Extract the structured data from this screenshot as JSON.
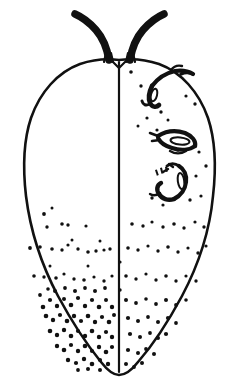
{
  "figure": {
    "subject_name": "scale-insect-dorsal-view",
    "background_color": "#ffffff",
    "ink_color": "#111111",
    "view": "dorsal",
    "canvas": {
      "width": 239,
      "height": 390
    },
    "style": "stippled pen-and-ink scientific illustration",
    "symmetry": "bilateral, right half bears appendages, left half plain"
  },
  "body": {
    "name": "body-outline",
    "shape": "ovoid, broadest above middle, tapering to rounded bilobed posterior",
    "outline_stroke_width": 2.6,
    "midline": {
      "name": "median-longitudinal-line",
      "x": 119,
      "y_top": 62,
      "y_bottom": 372,
      "stroke_width": 2.2
    },
    "extents": {
      "left_x": 24,
      "right_x": 215,
      "top_y": 58,
      "bottom_y": 376,
      "widest_y": 185
    },
    "outline_path": "M 119 60 C 104 58 92 60 80 64 C 58 72 40 92 31 118 C 23 142 23 170 26 196 C 30 228 41 264 58 296 C 72 322 88 346 101 362 C 108 371 113 375 119 375 C 125 375 131 371 138 362 C 152 346 168 322 182 296 C 199 264 210 228 213 196 C 216 170 216 142 208 118 C 199 92 181 72 159 64 C 147 60 134 58 119 60 Z"
  },
  "antennae": [
    {
      "name": "antenna-left",
      "side": "left",
      "segments": 7,
      "base_x": 109,
      "base_y": 58,
      "tip_x": 75,
      "tip_y": 14,
      "description": "thick segmented appendage curving up and outward with pale segment divisions"
    },
    {
      "name": "antenna-right",
      "side": "right",
      "segments": 7,
      "base_x": 130,
      "base_y": 58,
      "tip_x": 164,
      "tip_y": 14,
      "description": "thick segmented appendage curving up and outward, mirror of left"
    }
  ],
  "legs": [
    {
      "name": "leg-anterior-right",
      "position": "anterior right, crossing the body margin",
      "cx": 170,
      "cy": 78,
      "description": "slender jointed leg projecting beyond the body outline"
    },
    {
      "name": "leg-middle-right",
      "position": "mid right",
      "cx": 180,
      "cy": 140,
      "description": "flattened wing-like leg lying on the dorsum"
    },
    {
      "name": "leg-posterior-right",
      "position": "posterior right",
      "cx": 178,
      "cy": 185,
      "description": "bent jointed leg with pale femoral area"
    }
  ],
  "stippling": {
    "name": "dorsal-stippling",
    "description": "scattered pore/seta dots, sparse across the disc and very dense at the posterior left quadrant",
    "dot_color": "#111111",
    "density_zones": [
      {
        "zone": "upper-half",
        "density": "absent to very sparse"
      },
      {
        "zone": "mid-band-rows",
        "density": "sparse, aligned in loose transverse rows"
      },
      {
        "zone": "posterior-left",
        "density": "very dense cluster"
      },
      {
        "zone": "posterior-right",
        "density": "moderate"
      }
    ],
    "dots": [
      [
        44,
        214,
        1.9
      ],
      [
        47,
        227,
        1.7
      ],
      [
        62,
        224,
        1.8
      ],
      [
        68,
        225,
        1.7
      ],
      [
        86,
        226,
        1.6
      ],
      [
        52,
        208,
        1.5
      ],
      [
        30,
        248,
        1.9
      ],
      [
        40,
        247,
        1.8
      ],
      [
        52,
        249,
        1.8
      ],
      [
        62,
        250,
        1.7
      ],
      [
        68,
        245,
        1.6
      ],
      [
        78,
        249,
        1.7
      ],
      [
        88,
        252,
        1.8
      ],
      [
        96,
        251,
        1.7
      ],
      [
        104,
        250,
        1.6
      ],
      [
        110,
        249,
        1.7
      ],
      [
        100,
        241,
        1.5
      ],
      [
        72,
        240,
        1.5
      ],
      [
        34,
        276,
        1.8
      ],
      [
        44,
        277,
        1.7
      ],
      [
        56,
        278,
        1.8
      ],
      [
        64,
        274,
        1.6
      ],
      [
        74,
        279,
        1.7
      ],
      [
        84,
        280,
        1.8
      ],
      [
        94,
        277,
        1.6
      ],
      [
        104,
        281,
        1.7
      ],
      [
        112,
        276,
        1.6
      ],
      [
        50,
        266,
        1.5
      ],
      [
        88,
        266,
        1.5
      ],
      [
        43,
        307,
        2.3
      ],
      [
        50,
        300,
        2.1
      ],
      [
        57,
        306,
        2.2
      ],
      [
        64,
        299,
        2.0
      ],
      [
        71,
        305,
        2.3
      ],
      [
        78,
        298,
        2.1
      ],
      [
        85,
        306,
        2.2
      ],
      [
        92,
        300,
        2.1
      ],
      [
        99,
        307,
        2.3
      ],
      [
        106,
        300,
        2.0
      ],
      [
        112,
        307,
        2.2
      ],
      [
        46,
        316,
        2.3
      ],
      [
        53,
        320,
        2.2
      ],
      [
        60,
        315,
        2.1
      ],
      [
        67,
        321,
        2.3
      ],
      [
        74,
        316,
        2.2
      ],
      [
        81,
        321,
        2.1
      ],
      [
        88,
        316,
        2.3
      ],
      [
        95,
        322,
        2.2
      ],
      [
        102,
        317,
        2.1
      ],
      [
        109,
        322,
        2.3
      ],
      [
        114,
        315,
        2.0
      ],
      [
        50,
        331,
        2.3
      ],
      [
        57,
        335,
        2.2
      ],
      [
        64,
        330,
        2.2
      ],
      [
        71,
        336,
        2.3
      ],
      [
        78,
        331,
        2.1
      ],
      [
        85,
        336,
        2.2
      ],
      [
        92,
        331,
        2.3
      ],
      [
        99,
        337,
        2.2
      ],
      [
        106,
        332,
        2.1
      ],
      [
        112,
        337,
        2.2
      ],
      [
        57,
        346,
        2.2
      ],
      [
        64,
        350,
        2.3
      ],
      [
        71,
        345,
        2.1
      ],
      [
        78,
        351,
        2.2
      ],
      [
        85,
        346,
        2.3
      ],
      [
        92,
        351,
        2.1
      ],
      [
        99,
        347,
        2.2
      ],
      [
        106,
        352,
        2.3
      ],
      [
        112,
        347,
        2.1
      ],
      [
        68,
        360,
        2.2
      ],
      [
        76,
        363,
        2.1
      ],
      [
        84,
        359,
        2.2
      ],
      [
        92,
        364,
        2.3
      ],
      [
        100,
        360,
        2.1
      ],
      [
        108,
        364,
        2.2
      ],
      [
        88,
        369,
        2.0
      ],
      [
        100,
        370,
        2.0
      ],
      [
        78,
        370,
        1.9
      ],
      [
        55,
        291,
        2.0
      ],
      [
        65,
        288,
        1.9
      ],
      [
        75,
        291,
        2.0
      ],
      [
        85,
        288,
        1.9
      ],
      [
        95,
        291,
        2.0
      ],
      [
        105,
        288,
        1.9
      ],
      [
        40,
        295,
        1.9
      ],
      [
        48,
        289,
        1.8
      ],
      [
        131,
        72,
        1.8
      ],
      [
        141,
        86,
        1.7
      ],
      [
        152,
        98,
        1.6
      ],
      [
        161,
        112,
        1.7
      ],
      [
        147,
        118,
        1.6
      ],
      [
        138,
        126,
        1.5
      ],
      [
        157,
        130,
        1.6
      ],
      [
        168,
        120,
        1.5
      ],
      [
        195,
        104,
        1.7
      ],
      [
        186,
        96,
        1.6
      ],
      [
        178,
        150,
        1.7
      ],
      [
        199,
        152,
        1.6
      ],
      [
        206,
        166,
        1.7
      ],
      [
        196,
        176,
        1.6
      ],
      [
        152,
        198,
        1.7
      ],
      [
        163,
        205,
        1.6
      ],
      [
        190,
        200,
        1.7
      ],
      [
        201,
        196,
        1.6
      ],
      [
        132,
        224,
        1.8
      ],
      [
        143,
        226,
        1.7
      ],
      [
        152,
        222,
        1.6
      ],
      [
        163,
        227,
        1.7
      ],
      [
        174,
        224,
        1.8
      ],
      [
        184,
        228,
        1.7
      ],
      [
        195,
        222,
        1.6
      ],
      [
        204,
        227,
        1.7
      ],
      [
        128,
        248,
        1.8
      ],
      [
        138,
        250,
        1.7
      ],
      [
        148,
        246,
        1.6
      ],
      [
        158,
        251,
        1.7
      ],
      [
        168,
        247,
        1.8
      ],
      [
        178,
        252,
        1.7
      ],
      [
        188,
        248,
        1.6
      ],
      [
        198,
        253,
        1.7
      ],
      [
        206,
        246,
        1.6
      ],
      [
        126,
        276,
        1.8
      ],
      [
        136,
        279,
        1.7
      ],
      [
        146,
        274,
        1.6
      ],
      [
        156,
        280,
        1.7
      ],
      [
        166,
        276,
        1.8
      ],
      [
        176,
        281,
        1.7
      ],
      [
        186,
        276,
        1.6
      ],
      [
        196,
        281,
        1.7
      ],
      [
        126,
        300,
        2.0
      ],
      [
        136,
        303,
        1.9
      ],
      [
        146,
        299,
        1.8
      ],
      [
        156,
        304,
        1.9
      ],
      [
        166,
        300,
        2.0
      ],
      [
        176,
        305,
        1.9
      ],
      [
        186,
        300,
        1.8
      ],
      [
        128,
        318,
        2.1
      ],
      [
        138,
        321,
        2.0
      ],
      [
        148,
        317,
        1.9
      ],
      [
        158,
        322,
        2.0
      ],
      [
        168,
        318,
        2.1
      ],
      [
        176,
        323,
        1.9
      ],
      [
        130,
        334,
        2.1
      ],
      [
        140,
        337,
        2.0
      ],
      [
        150,
        333,
        1.9
      ],
      [
        158,
        338,
        2.0
      ],
      [
        166,
        334,
        2.1
      ],
      [
        128,
        350,
        2.1
      ],
      [
        138,
        353,
        2.0
      ],
      [
        146,
        349,
        1.9
      ],
      [
        154,
        354,
        2.0
      ],
      [
        126,
        364,
        2.0
      ],
      [
        134,
        367,
        1.9
      ],
      [
        142,
        363,
        2.0
      ],
      [
        120,
        262,
        1.6
      ],
      [
        120,
        290,
        1.7
      ]
    ]
  },
  "labels": {
    "visible_text": "none",
    "note": "The illustration carries no printed text, numbers, or scale bar."
  }
}
